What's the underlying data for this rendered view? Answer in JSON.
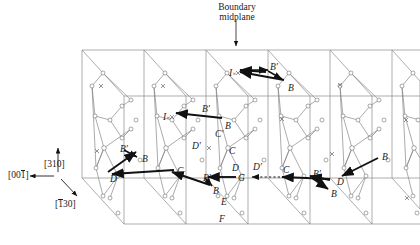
{
  "figure": {
    "title_line1": "Boundary",
    "title_line2": "midplane",
    "kind": "crystallographic-grain-boundary-schematic"
  },
  "axes": {
    "vertical": {
      "text": "[310]",
      "pre": "[310]",
      "bar": "",
      "post": ""
    },
    "horizontal": {
      "pre": "[00",
      "bar": "1",
      "post": "]"
    },
    "depth": {
      "pre": "[",
      "bar": "1",
      "post": "30]"
    }
  },
  "point_labels": [
    {
      "id": "p1",
      "base": "I",
      "prime": false,
      "cross": true,
      "x": 229,
      "y": 69
    },
    {
      "id": "p2",
      "base": "B",
      "prime": true,
      "cross": false,
      "x": 270,
      "y": 63
    },
    {
      "id": "p3",
      "base": "B",
      "prime": false,
      "cross": false,
      "x": 288,
      "y": 84
    },
    {
      "id": "p4",
      "base": "I",
      "prime": false,
      "cross": true,
      "x": 163,
      "y": 113
    },
    {
      "id": "p5",
      "base": "B",
      "prime": true,
      "cross": false,
      "x": 202,
      "y": 105
    },
    {
      "id": "p6",
      "base": "B",
      "prime": false,
      "cross": false,
      "x": 225,
      "y": 122
    },
    {
      "id": "p7",
      "base": "C",
      "prime": true,
      "cross": false,
      "x": 215,
      "y": 130
    },
    {
      "id": "p8",
      "base": "D",
      "prime": true,
      "cross": false,
      "x": 192,
      "y": 142
    },
    {
      "id": "p9",
      "base": "C",
      "prime": false,
      "cross": false,
      "x": 229,
      "y": 147
    },
    {
      "id": "p10",
      "base": "B",
      "prime": true,
      "cross": false,
      "x": 120,
      "y": 145
    },
    {
      "id": "p11",
      "base": "B",
      "prime": false,
      "cross": false,
      "x": 142,
      "y": 155
    },
    {
      "id": "p12",
      "base": "D",
      "prime": false,
      "cross": false,
      "x": 110,
      "y": 175
    },
    {
      "id": "p13",
      "base": "C",
      "prime": false,
      "cross": false,
      "x": 177,
      "y": 167
    },
    {
      "id": "p14",
      "base": "D",
      "prime": false,
      "cross": false,
      "x": 232,
      "y": 164
    },
    {
      "id": "p15",
      "base": "D",
      "prime": true,
      "cross": false,
      "x": 253,
      "y": 163
    },
    {
      "id": "p16",
      "base": "G",
      "prime": false,
      "cross": false,
      "x": 238,
      "y": 174
    },
    {
      "id": "p17",
      "base": "C",
      "prime": false,
      "cross": false,
      "x": 283,
      "y": 166
    },
    {
      "id": "p18",
      "base": "B",
      "prime": true,
      "cross": false,
      "x": 203,
      "y": 174
    },
    {
      "id": "p19",
      "base": "B",
      "prime": false,
      "cross": false,
      "x": 213,
      "y": 187
    },
    {
      "id": "p20",
      "base": "E",
      "prime": false,
      "cross": false,
      "x": 221,
      "y": 198
    },
    {
      "id": "p21",
      "base": "F",
      "prime": false,
      "cross": false,
      "x": 219,
      "y": 215
    },
    {
      "id": "p22",
      "base": "B",
      "prime": true,
      "cross": false,
      "x": 313,
      "y": 170
    },
    {
      "id": "p23",
      "base": "D",
      "prime": false,
      "cross": false,
      "x": 337,
      "y": 178
    },
    {
      "id": "p24",
      "base": "B",
      "prime": false,
      "cross": false,
      "x": 331,
      "y": 190
    },
    {
      "id": "p25",
      "base": "B",
      "prime": false,
      "cross": false,
      "x": 382,
      "y": 153
    }
  ],
  "colors": {
    "plane_line": "#8a8a8a",
    "network_line": "#7d7d7d",
    "atom_stroke": "#6f6f6f",
    "arrow": "#111111",
    "text": "#1a1a1a"
  },
  "planes": {
    "count": 6,
    "spacing": 62,
    "origin_x": 82,
    "top_y": 50,
    "height": 128,
    "slant_x": 42,
    "slant_y": 46
  }
}
